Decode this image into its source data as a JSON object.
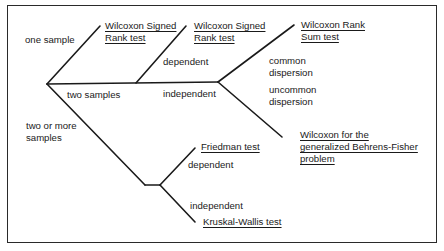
{
  "diagram": {
    "type": "decision-tree",
    "line_color": "#1a1a1a",
    "root_branches": {
      "one_sample": "one sample",
      "two_samples": "two samples",
      "two_or_more": [
        "two or more",
        "samples"
      ]
    },
    "conditions": {
      "dependent_two": "dependent",
      "independent_two": "independent",
      "common_dispersion": [
        "common",
        "dispersion"
      ],
      "uncommon_dispersion": [
        "uncommon",
        "dispersion"
      ],
      "dependent_many": "dependent",
      "independent_many": "independent"
    },
    "tests": {
      "signed_rank_one": [
        "Wilcoxon Signed",
        "Rank test"
      ],
      "signed_rank_two": [
        "Wilcoxon Signed",
        "Rank test"
      ],
      "rank_sum": [
        "Wilcoxon Rank",
        "Sum test"
      ],
      "behrens_fisher": [
        "Wilcoxon for the",
        "generalized Behrens-Fisher",
        "problem"
      ],
      "friedman": "Friedman test",
      "kruskal_wallis": "Kruskal-Wallis test"
    }
  }
}
